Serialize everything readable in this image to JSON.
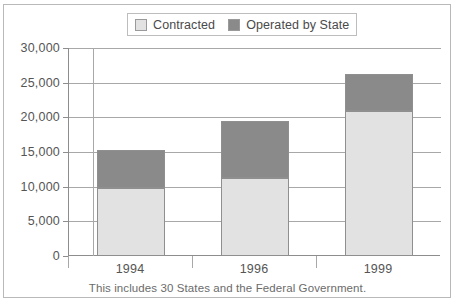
{
  "chart_data": {
    "type": "bar",
    "subtype": "stacked-vertical",
    "title": "",
    "xlabel": "",
    "ylabel": "",
    "categories": [
      "1994",
      "1996",
      "1999"
    ],
    "series": [
      {
        "name": "Contracted",
        "values": [
          9800,
          11250,
          20900
        ],
        "color": "#e2e2e2"
      },
      {
        "name": "Operated by State",
        "values": [
          5500,
          8250,
          5350
        ],
        "color": "#8a8a8a"
      }
    ],
    "totals": [
      15300,
      19500,
      26250
    ],
    "ylim": [
      0,
      30000
    ],
    "yticks": [
      0,
      5000,
      10000,
      15000,
      20000,
      25000,
      30000
    ],
    "ytick_labels": [
      "0",
      "5,000",
      "10,000",
      "15,000",
      "20,000",
      "25,000",
      "30,000"
    ],
    "grid": true,
    "legend_position": "top-center",
    "annotation": "This includes 30 States and the Federal Government."
  },
  "legend": {
    "items": [
      {
        "label": "Contracted",
        "color": "#e2e2e2"
      },
      {
        "label": "Operated by State",
        "color": "#8a8a8a"
      }
    ]
  },
  "caption": {
    "text": "This includes 30 States and the Federal Government."
  }
}
